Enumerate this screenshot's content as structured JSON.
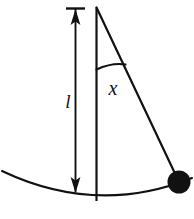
{
  "figure": {
    "kind": "pendulum-diagram",
    "width": 194,
    "height": 219,
    "background_color": "#ffffff",
    "stroke_color": "#111111",
    "bob_fill_color": "#111111",
    "labels": {
      "length_label": "l",
      "displacement_label": "x"
    },
    "geometry": {
      "pivot": {
        "x": 96.5,
        "y": 7.5
      },
      "rod_bottom": {
        "x": 96.5,
        "y": 201
      },
      "bob_center": {
        "x": 179,
        "y": 182
      },
      "bob_radius": 11.5,
      "dimension_line_x": 75.5,
      "dimension_top_y": 8,
      "dimension_bottom_y": 193,
      "arc_start": {
        "x": 2,
        "y": 171
      },
      "arc_end": {
        "x": 192,
        "y": 178
      },
      "arc_low_point": {
        "x": 100,
        "y": 201
      },
      "angle_marker_start": {
        "x": 96.5,
        "y": 69
      },
      "angle_marker_end": {
        "x": 125,
        "y": 64
      }
    },
    "label_positions": {
      "l": {
        "x": 68,
        "y": 103
      },
      "x": {
        "x": 113,
        "y": 89
      }
    }
  }
}
